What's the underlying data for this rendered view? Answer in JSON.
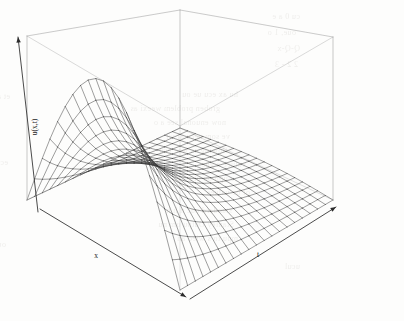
{
  "figure": {
    "kind": "3d-perspective-surface-plot",
    "background_color": "#fdfdfc",
    "box_line_color": "#a8a8a8",
    "mesh_line_color": "#3a3a3a",
    "axis_line_color": "#2b2b2b",
    "width_px": 404,
    "height_px": 321
  },
  "axes": {
    "x": {
      "label": "x",
      "label_x": 96,
      "label_y": 258,
      "arrow": "down-right"
    },
    "t": {
      "label": "t",
      "label_x": 258,
      "label_y": 257,
      "arrow": "up-right"
    },
    "z": {
      "label": "u(x,t)",
      "label_x": 37,
      "label_y": 127,
      "rotation_deg": -90,
      "arrow": "up-left"
    }
  },
  "chart_data": {
    "type": "surface",
    "title": "",
    "xlabel": "x",
    "ylabel": "t",
    "zlabel": "u(x,t)",
    "xlim": [
      0,
      1
    ],
    "ylim": [
      0,
      1
    ],
    "zlim": [
      0,
      1
    ],
    "grid": false,
    "legend": "none",
    "nx": 21,
    "nt": 21,
    "surface_description": "Decaying sine wave: u(x,t) = sin(pi*x) * exp(-k*t); single hump in x at t=0 that decays to a flat zero sheet as t increases.",
    "formula": {
      "expression": "sin(pi*x)*exp(-3.2*t)",
      "amplitude": 1.0,
      "decay_rate": 3.2,
      "modes": 1
    },
    "samples": [
      {
        "x": 0.0,
        "t": 0.0,
        "u": 0.0
      },
      {
        "x": 0.1,
        "t": 0.0,
        "u": 0.31
      },
      {
        "x": 0.2,
        "t": 0.0,
        "u": 0.59
      },
      {
        "x": 0.3,
        "t": 0.0,
        "u": 0.81
      },
      {
        "x": 0.4,
        "t": 0.0,
        "u": 0.95
      },
      {
        "x": 0.5,
        "t": 0.0,
        "u": 1.0
      },
      {
        "x": 0.6,
        "t": 0.0,
        "u": 0.95
      },
      {
        "x": 0.7,
        "t": 0.0,
        "u": 0.81
      },
      {
        "x": 0.8,
        "t": 0.0,
        "u": 0.59
      },
      {
        "x": 0.9,
        "t": 0.0,
        "u": 0.31
      },
      {
        "x": 1.0,
        "t": 0.0,
        "u": 0.0
      },
      {
        "x": 0.5,
        "t": 0.2,
        "u": 0.53
      },
      {
        "x": 0.5,
        "t": 0.4,
        "u": 0.28
      },
      {
        "x": 0.5,
        "t": 0.6,
        "u": 0.15
      },
      {
        "x": 0.5,
        "t": 0.8,
        "u": 0.08
      },
      {
        "x": 0.5,
        "t": 1.0,
        "u": 0.04
      }
    ],
    "view": {
      "theta_deg": -38,
      "phi_deg": 22,
      "projection": "perspective",
      "box": true,
      "ticks": false
    }
  },
  "page_bleed": {
    "note": "faint show-through text from reverse side of scanned page",
    "lines": [
      {
        "text": "cu 0  a e",
        "x": 300,
        "y": 12,
        "size": 8
      },
      {
        "text": "oue, 1 o",
        "x": 296,
        "y": 28,
        "size": 8
      },
      {
        "text": "Q-Q-x",
        "x": 300,
        "y": 44,
        "size": 8
      },
      {
        "text": "2   2 - 3",
        "x": 298,
        "y": 60,
        "size": 8
      },
      {
        "text": "hu  ax ecu   ue  ou",
        "x": 238,
        "y": 90,
        "size": 8
      },
      {
        "text": "groben problem weexi  as",
        "x": 220,
        "y": 104,
        "size": 8
      },
      {
        "text": "now  enuonal see  a o",
        "x": 226,
        "y": 118,
        "size": 8
      },
      {
        "text": "ve  som  nece al  wi",
        "x": 230,
        "y": 132,
        "size": 8
      },
      {
        "text": "flowing  as  wee  ecu",
        "x": 228,
        "y": 146,
        "size": 8
      },
      {
        "text": "valuee  a  gue",
        "x": 246,
        "y": 160,
        "size": 8
      },
      {
        "text": "e  upp  ou  ut a  t e",
        "x": 234,
        "y": 174,
        "size": 8
      },
      {
        "text": "of  be  values",
        "x": 250,
        "y": 188,
        "size": 8
      },
      {
        "text": "standard  ouc  n  h  h",
        "x": 232,
        "y": 206,
        "size": 8
      },
      {
        "text": "Stanley  Outpu   om  nu",
        "x": 234,
        "y": 220,
        "size": 8
      },
      {
        "text": "mpu  to  s  wieo   an",
        "x": 238,
        "y": 234,
        "size": 8
      },
      {
        "text": "ucul",
        "x": 300,
        "y": 262,
        "size": 8
      },
      {
        "text": "et a  ke  moi",
        "x": 10,
        "y": 92,
        "size": 8
      },
      {
        "text": "ecu  ee",
        "x": 8,
        "y": 158,
        "size": 8
      },
      {
        "text": "oum   ge",
        "x": 6,
        "y": 240,
        "size": 8
      }
    ]
  }
}
